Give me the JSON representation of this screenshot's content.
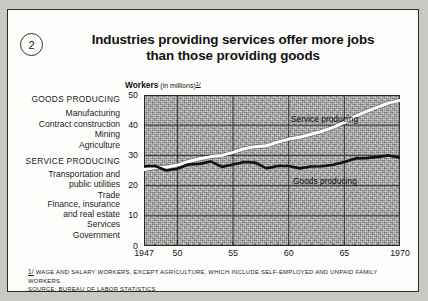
{
  "badge": {
    "number": "2"
  },
  "title": {
    "line1": "Industries providing services offer more jobs",
    "line2": "than those providing goods"
  },
  "axis_title": {
    "main": "Workers",
    "sub": "(in millions)",
    "footnote_mark": "1/"
  },
  "categories": {
    "goods_header": "GOODS PRODUCING",
    "goods_items": [
      "Manufacturing",
      "Contract construction",
      "Mining",
      "Agriculture"
    ],
    "service_header": "SERVICE PRODUCING",
    "service_items": [
      "Transportation and",
      "public utilities",
      "Trade",
      "Finance, insurance",
      "and real estate",
      "Services",
      "Government"
    ]
  },
  "footnote": {
    "mark": "1/",
    "line1": "WAGE AND SALARY WORKERS, EXCEPT AGRICULTURE, WHICH INCLUDE SELF-EMPLOYED AND UNPAID FAMILY WORKERS.",
    "line2": "SOURCE: BUREAU OF LABOR STATISTICS"
  },
  "colors": {
    "service_line": "#ffffff",
    "goods_line": "#121212",
    "plot_background": "#a9a9a6",
    "grid": "#2a2a2a"
  },
  "chart_data": {
    "type": "line",
    "title": "Industries providing services offer more jobs than those providing goods",
    "xlabel": "",
    "ylabel": "Workers (in millions)",
    "xlim": [
      1947,
      1970
    ],
    "ylim": [
      0,
      50
    ],
    "ytick_labels": [
      "0",
      "10",
      "20",
      "30",
      "40",
      "50"
    ],
    "ytick_values": [
      0,
      10,
      20,
      30,
      40,
      50
    ],
    "xtick_labels": [
      "1947",
      "50",
      "55",
      "60",
      "65",
      "1970"
    ],
    "xtick_values": [
      1947,
      1950,
      1955,
      1960,
      1965,
      1970
    ],
    "grid": true,
    "legend": "in-plot labels",
    "x": [
      1947,
      1948,
      1949,
      1950,
      1951,
      1952,
      1953,
      1954,
      1955,
      1956,
      1957,
      1958,
      1959,
      1960,
      1961,
      1962,
      1963,
      1964,
      1965,
      1966,
      1967,
      1968,
      1969,
      1970
    ],
    "series": [
      {
        "name": "Service producing",
        "label": "Service producing",
        "color": "#ffffff",
        "values": [
          25.3,
          26.0,
          26.1,
          26.8,
          28.0,
          28.9,
          29.6,
          30.0,
          31.0,
          32.2,
          32.9,
          33.2,
          34.4,
          35.4,
          36.0,
          37.0,
          38.0,
          39.3,
          40.9,
          43.0,
          44.6,
          46.0,
          47.4,
          48.2
        ]
      },
      {
        "name": "Goods producing",
        "label": "Goods producing",
        "color": "#121212",
        "values": [
          26.4,
          26.5,
          25.0,
          25.6,
          27.0,
          27.2,
          28.0,
          26.2,
          27.0,
          27.8,
          27.6,
          25.7,
          26.5,
          26.5,
          25.7,
          26.3,
          26.4,
          26.9,
          27.8,
          29.0,
          29.1,
          29.5,
          30.0,
          29.2
        ]
      }
    ]
  }
}
